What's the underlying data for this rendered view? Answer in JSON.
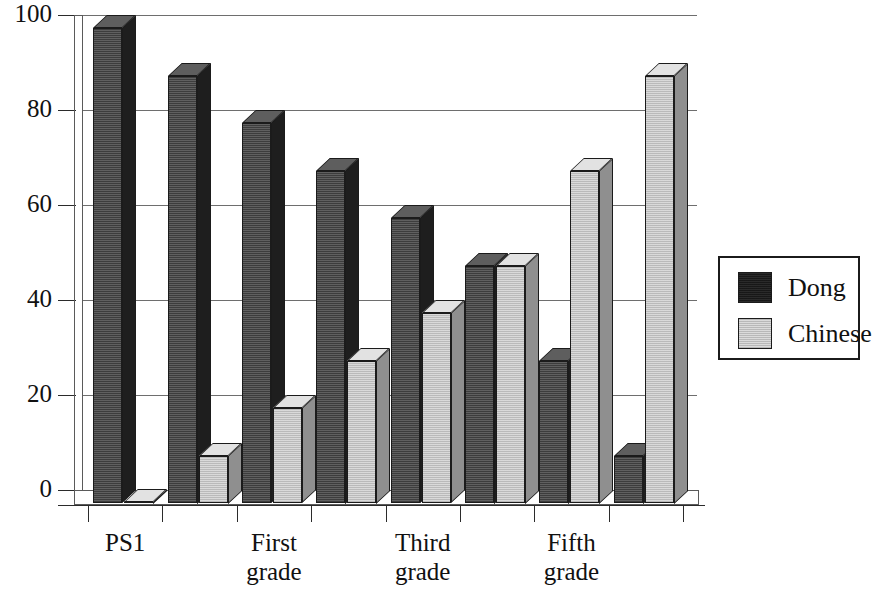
{
  "chart_data": {
    "type": "bar",
    "title": "",
    "subtitle": "",
    "xlabel": "",
    "ylabel": "",
    "ylim": [
      0,
      100
    ],
    "yticks": [
      0,
      20,
      40,
      60,
      80,
      100
    ],
    "grid": true,
    "legend_position": "right",
    "style": "3d-clustered-column",
    "categories": [
      "PS1",
      "",
      "First\ngrade",
      "",
      "Third\ngrade",
      "",
      "Fifth\ngrade",
      ""
    ],
    "category_tick_labels": [
      "PS1",
      "First grade",
      "Third grade",
      "Fifth grade"
    ],
    "series": [
      {
        "name": "Dong",
        "color": "#1d1d1d",
        "values": [
          100,
          90,
          80,
          70,
          60,
          50,
          30,
          10
        ]
      },
      {
        "name": "Chinese",
        "color": "#d2d2d2",
        "values": [
          0,
          10,
          20,
          30,
          40,
          50,
          70,
          90
        ]
      }
    ]
  },
  "axis": {
    "y_tick_labels": [
      "100",
      "80",
      "60",
      "40",
      "20",
      "0"
    ]
  },
  "legend": {
    "entries": [
      {
        "label": "Dong",
        "swatch": "dark-swatch"
      },
      {
        "label": "Chinese",
        "swatch": "light-swatch"
      }
    ]
  },
  "x_axis": {
    "group_labels": [
      {
        "line1": "PS1",
        "line2": ""
      },
      {
        "line1": "",
        "line2": ""
      },
      {
        "line1": "First",
        "line2": "grade"
      },
      {
        "line1": "",
        "line2": ""
      },
      {
        "line1": "Third",
        "line2": "grade"
      },
      {
        "line1": "",
        "line2": ""
      },
      {
        "line1": "Fifth",
        "line2": "grade"
      },
      {
        "line1": "",
        "line2": ""
      }
    ]
  }
}
